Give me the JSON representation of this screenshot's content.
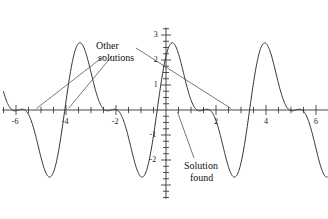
{
  "figure": {
    "kind": "math-function-plot",
    "background_color": "#ffffff",
    "stroke_color": "#333333",
    "text_color": "#111111"
  },
  "annotations": [
    {
      "name": "other-solutions",
      "line1": "Other",
      "line2": "solutions"
    },
    {
      "name": "solution-found",
      "line1": "Solution",
      "line2": "found"
    }
  ],
  "chart_data": {
    "type": "line",
    "title": "",
    "xlabel": "",
    "ylabel": "",
    "grid": false,
    "legend": null,
    "xlim": [
      -6.55,
      6.5
    ],
    "ylim": [
      -3.55,
      3.3
    ],
    "x_ticks_major": [
      -6,
      -4,
      -2,
      2,
      4,
      6
    ],
    "x_tick_labels": [
      "-6",
      "-4",
      "-2",
      "2",
      "4",
      "6"
    ],
    "x_tick_step_minor": 0.5,
    "y_ticks_major": [
      -2,
      -1,
      1,
      2,
      3
    ],
    "y_tick_labels": [
      "-2",
      "-1",
      "1",
      "2",
      "3"
    ],
    "y_tick_step_minor": 0.25,
    "series": [
      {
        "name": "wave-curve",
        "expression": "2*sin(1.7*x + 0.6) + 1.1*sin(3.4*x + 1.2)",
        "x_start": -6.5,
        "x_end": 6.45,
        "samples": 700
      },
      {
        "name": "secant-line",
        "expression": "line",
        "x_start": -6.0,
        "x_end": 2.6,
        "y_start": 0.0,
        "y_end": 0.0
      }
    ],
    "marked_roots": [
      {
        "label": "other-solution-left-a",
        "x": -5.8,
        "y": 0
      },
      {
        "label": "other-solution-left-b",
        "x": -3.92,
        "y": 0
      },
      {
        "label": "other-solution-right",
        "x": 2.6,
        "y": 0
      },
      {
        "label": "solution-found",
        "x": 0.5,
        "y": 0
      }
    ],
    "leader_lines": [
      {
        "from_name": "other-solutions",
        "to_root": "other-solution-left-a"
      },
      {
        "from_name": "other-solutions",
        "to_root": "other-solution-left-b"
      },
      {
        "from_name": "other-solutions",
        "to_root": "other-solution-right"
      },
      {
        "from_name": "solution-found",
        "to_root": "solution-found"
      }
    ]
  }
}
